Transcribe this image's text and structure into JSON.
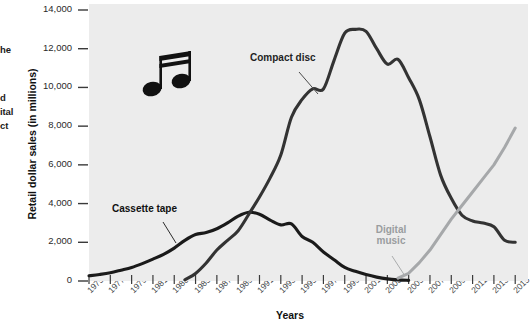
{
  "figure": {
    "background": "#ffffff",
    "plot_background": "#ececec",
    "caption_fragments": [
      {
        "text": "he",
        "x": 0,
        "y": 45
      },
      {
        "text": "d",
        "x": 0,
        "y": 93
      },
      {
        "text": "ital",
        "x": 0,
        "y": 107
      },
      {
        "text": "ct",
        "x": 0,
        "y": 121
      }
    ],
    "music_note_icon": "eighth-note-pair-icon"
  },
  "chart_data": {
    "type": "line",
    "title": "",
    "xlabel": "Years",
    "ylabel": "Retail dollar sales (in millions)",
    "xlim": [
      1975,
      2015
    ],
    "ylim": [
      0,
      14000
    ],
    "grid": false,
    "legend": "inline-annotations",
    "ytick_labels": [
      "14,000",
      "12,000",
      "10,000",
      "8,000",
      "6,000",
      "4,000",
      "2,000",
      "0"
    ],
    "ytick_values": [
      14000,
      12000,
      10000,
      8000,
      6000,
      4000,
      2000,
      0
    ],
    "xtick_labels": [
      "1975",
      "1977",
      "1979",
      "1981",
      "1983",
      "1985",
      "1987",
      "1989",
      "1991",
      "1993",
      "1995",
      "1997",
      "1999",
      "2001",
      "2003",
      "2005",
      "2007",
      "2009",
      "2011",
      "2013",
      "2015"
    ],
    "xtick_values": [
      1975,
      1977,
      1979,
      1981,
      1983,
      1985,
      1987,
      1989,
      1991,
      1993,
      1995,
      1997,
      1999,
      2001,
      2003,
      2005,
      2007,
      2009,
      2011,
      2013,
      2015
    ],
    "series": [
      {
        "name": "Cassette tape",
        "label": "Cassette tape",
        "color": "#1a1a1a",
        "x": [
          1975,
          1976,
          1977,
          1978,
          1979,
          1980,
          1981,
          1982,
          1983,
          1984,
          1985,
          1986,
          1987,
          1988,
          1989,
          1990,
          1991,
          1992,
          1993,
          1994,
          1995,
          1996,
          1997,
          1998,
          1999,
          2000,
          2001,
          2002,
          2003,
          2004,
          2005
        ],
        "values": [
          270,
          340,
          430,
          560,
          700,
          900,
          1130,
          1380,
          1700,
          2100,
          2400,
          2500,
          2700,
          3000,
          3350,
          3550,
          3450,
          3150,
          2900,
          2950,
          2300,
          2000,
          1500,
          1100,
          700,
          500,
          330,
          200,
          110,
          60,
          30
        ]
      },
      {
        "name": "Compact disc",
        "label": "Compact disc",
        "color": "#333333",
        "x": [
          1984,
          1985,
          1986,
          1987,
          1988,
          1989,
          1990,
          1991,
          1992,
          1993,
          1994,
          1995,
          1996,
          1997,
          1998,
          1999,
          2000,
          2001,
          2002,
          2003,
          2004,
          2005,
          2006,
          2007,
          2008,
          2009,
          2010,
          2011,
          2012,
          2013,
          2014,
          2015
        ],
        "values": [
          60,
          390,
          930,
          1600,
          2100,
          2600,
          3450,
          4340,
          5330,
          6510,
          8460,
          9380,
          9930,
          9920,
          11400,
          12800,
          13000,
          12900,
          12000,
          11200,
          11450,
          10500,
          9370,
          7450,
          5470,
          4270,
          3400,
          3100,
          2990,
          2800,
          2100,
          2000
        ]
      },
      {
        "name": "Digital music",
        "label": "Digital music",
        "color": "#a6a8aa",
        "x": [
          2004,
          2005,
          2006,
          2007,
          2008,
          2009,
          2010,
          2011,
          2012,
          2013,
          2014,
          2015
        ],
        "values": [
          150,
          400,
          950,
          1600,
          2400,
          3200,
          3900,
          4600,
          5300,
          6000,
          6900,
          7900
        ]
      }
    ],
    "annotations": [
      {
        "name": "compact-disc-label",
        "text": "Compact disc",
        "x": 250,
        "y": 58,
        "color": "#1f1f1f"
      },
      {
        "name": "cassette-tape-label",
        "text": "Cassette tape",
        "x": 112,
        "y": 209,
        "color": "#111111"
      },
      {
        "name": "digital-music-label",
        "text": "Digital music",
        "line1": "Digital",
        "line2": "music",
        "x": 366,
        "y": 230,
        "color": "#9a9d9f"
      }
    ]
  }
}
